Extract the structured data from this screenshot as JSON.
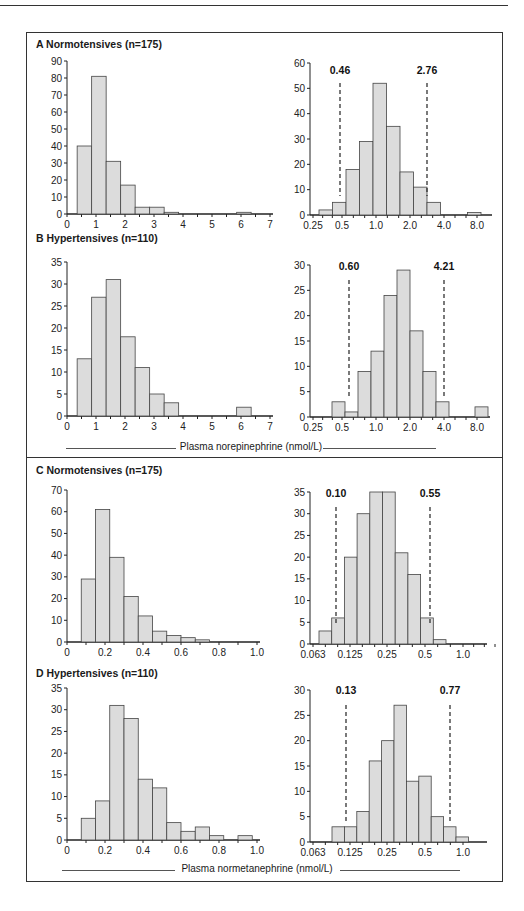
{
  "figure": {
    "x_label_top": "Plasma norepinephrine (nmol/L)",
    "x_label_bottom": "Plasma normetanephrine (nmol/L)"
  },
  "panels": [
    {
      "id": "A",
      "title": "A  Normotensives (n=175)"
    },
    {
      "id": "B",
      "title": "B Hypertensives (n=110)"
    },
    {
      "id": "C",
      "title": "C  Normotensives (n=175)"
    },
    {
      "id": "D",
      "title": "D Hypertensives (n=110)"
    }
  ],
  "chart_data": [
    {
      "id": "A-linear",
      "type": "bar",
      "title": "A Normotensives (n=175)",
      "xlabel": "Plasma norepinephrine (nmol/L)",
      "ylabel": "",
      "xlim": [
        0,
        7
      ],
      "ylim": [
        0,
        90
      ],
      "yticks": [
        0,
        10,
        20,
        30,
        40,
        50,
        60,
        70,
        80,
        90
      ],
      "xticks": [
        "0",
        "1",
        "2",
        "3",
        "4",
        "5",
        "6",
        "7"
      ],
      "bin_width": 0.5,
      "bin_starts": [
        0.35,
        0.85,
        1.35,
        1.85,
        2.35,
        2.85,
        3.35,
        5.85
      ],
      "values": [
        40,
        81,
        31,
        17,
        4,
        4,
        1,
        1
      ]
    },
    {
      "id": "A-log",
      "type": "bar",
      "title": "A Normotensives (n=175), log scale",
      "xlabel": "Plasma norepinephrine (nmol/L)",
      "ylabel": "",
      "ylim": [
        0,
        60
      ],
      "yticks": [
        0,
        10,
        20,
        30,
        40,
        50,
        60
      ],
      "xticks": [
        "0.25",
        "0.5",
        "1.0",
        "2.0",
        "4.0",
        "8.0"
      ],
      "bins_from_tick0": [
        0.2,
        1.4,
        2.6,
        3.8,
        5.0,
        6.2,
        7.4,
        8.6,
        9.8,
        13.0
      ],
      "values": [
        2,
        5,
        18,
        29,
        52,
        35,
        17,
        11,
        5,
        1
      ],
      "reference_lines": [
        {
          "label": "0.46"
        },
        {
          "label": "2.76"
        }
      ]
    },
    {
      "id": "B-linear",
      "type": "bar",
      "title": "B Hypertensives (n=110)",
      "xlabel": "Plasma norepinephrine (nmol/L)",
      "ylabel": "",
      "xlim": [
        0,
        7
      ],
      "ylim": [
        0,
        35
      ],
      "yticks": [
        0,
        5,
        10,
        15,
        20,
        25,
        30,
        35
      ],
      "xticks": [
        "0",
        "1",
        "2",
        "3",
        "4",
        "5",
        "6",
        "7"
      ],
      "bin_width": 0.5,
      "bin_starts": [
        0.35,
        0.85,
        1.35,
        1.85,
        2.35,
        2.85,
        3.35,
        5.85
      ],
      "values": [
        13,
        27,
        31,
        18,
        11,
        5,
        3,
        2
      ]
    },
    {
      "id": "B-log",
      "type": "bar",
      "title": "B Hypertensives (n=110), log scale",
      "xlabel": "Plasma norepinephrine (nmol/L)",
      "ylabel": "",
      "ylim": [
        0,
        30
      ],
      "yticks": [
        0,
        5,
        10,
        15,
        20,
        25,
        30
      ],
      "xticks": [
        "0.25",
        "0.5",
        "1.0",
        "2.0",
        "4.0",
        "8.0"
      ],
      "values": [
        3,
        1,
        9,
        13,
        24,
        29,
        17,
        9,
        3,
        2
      ],
      "reference_lines": [
        {
          "label": "0.60"
        },
        {
          "label": "4.21"
        }
      ]
    },
    {
      "id": "C-linear",
      "type": "bar",
      "title": "C Normotensives (n=175)",
      "xlabel": "Plasma normetanephrine (nmol/L)",
      "ylabel": "",
      "xlim": [
        0,
        1.0
      ],
      "ylim": [
        0,
        70
      ],
      "yticks": [
        0,
        10,
        20,
        30,
        40,
        50,
        60,
        70
      ],
      "xticks": [
        "0",
        "0.2",
        "0.4",
        "0.6",
        "0.8",
        "1.0"
      ],
      "values": [
        29,
        61,
        39,
        21,
        12,
        5,
        3,
        2,
        1
      ]
    },
    {
      "id": "C-log",
      "type": "bar",
      "title": "C Normotensives (n=175), log scale",
      "xlabel": "Plasma normetanephrine (nmol/L)",
      "ylabel": "",
      "ylim": [
        0,
        35
      ],
      "yticks": [
        0,
        5,
        10,
        15,
        20,
        25,
        30,
        35
      ],
      "xticks": [
        "0.063",
        "0.125",
        "0.25",
        "0.5",
        "1.0"
      ],
      "values": [
        3,
        6,
        20,
        30,
        35,
        35,
        21,
        16,
        6,
        1
      ],
      "reference_lines": [
        {
          "label": "0.10"
        },
        {
          "label": "0.55"
        }
      ]
    },
    {
      "id": "D-linear",
      "type": "bar",
      "title": "D Hypertensives (n=110)",
      "xlabel": "Plasma normetanephrine (nmol/L)",
      "ylabel": "",
      "xlim": [
        0,
        1.0
      ],
      "ylim": [
        0,
        35
      ],
      "yticks": [
        0,
        5,
        10,
        15,
        20,
        25,
        30,
        35
      ],
      "xticks": [
        "0",
        "0.2",
        "0.4",
        "0.6",
        "0.8",
        "1.0"
      ],
      "values": [
        5,
        9,
        31,
        28,
        14,
        12,
        4,
        2,
        3,
        1,
        0,
        1
      ]
    },
    {
      "id": "D-log",
      "type": "bar",
      "title": "D Hypertensives (n=110), log scale",
      "xlabel": "Plasma normetanephrine (nmol/L)",
      "ylabel": "",
      "ylim": [
        0,
        30
      ],
      "yticks": [
        0,
        5,
        10,
        15,
        20,
        25,
        30
      ],
      "xticks": [
        "0.063",
        "0.125",
        "0.25",
        "0.5",
        "1.0"
      ],
      "values": [
        3,
        3,
        6,
        16,
        20,
        27,
        12,
        13,
        5,
        3,
        1
      ],
      "reference_lines": [
        {
          "label": "0.13"
        },
        {
          "label": "0.77"
        }
      ]
    }
  ]
}
